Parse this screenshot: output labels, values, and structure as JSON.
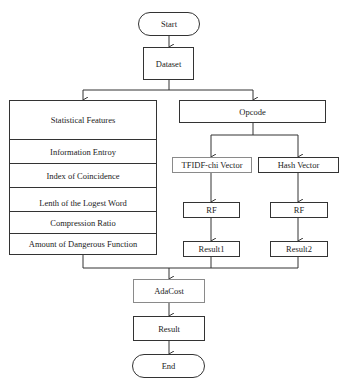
{
  "flowchart": {
    "start": "Start",
    "dataset": "Dataset",
    "statistical_features": {
      "title": "Statistical Features",
      "items": [
        "Information Entroy",
        "Index of Coincidence",
        "Lenth of the Logest Word",
        "Compression Ratio",
        "Amount of Dangerous Function"
      ]
    },
    "opcode": "Opcode",
    "tfidf_vector": "TFIDF-chi Vector",
    "hash_vector": "Hash Vector",
    "rf_left": "RF",
    "rf_right": "RF",
    "result1": "Result1",
    "result2": "Result2",
    "adacost": "AdaCost",
    "result": "Result",
    "end": "End"
  },
  "colors": {
    "line": "#333333",
    "light_border": "#8a8a8a",
    "background": "#ffffff"
  }
}
